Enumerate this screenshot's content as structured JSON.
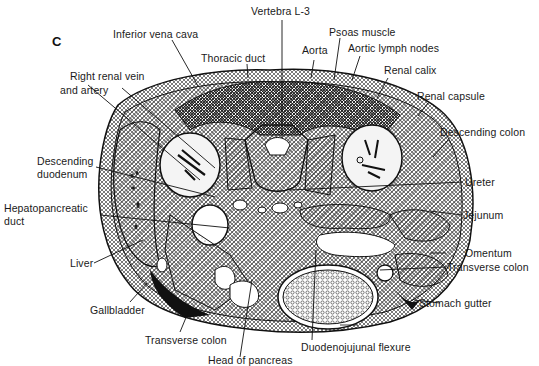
{
  "figure": {
    "panel_letter": "C",
    "colors": {
      "ink": "#1a1a1a",
      "background": "#ffffff",
      "light_tissue": "#f4f4f4"
    }
  },
  "labels": {
    "vertebra": "Vertebra L-3",
    "inferior_vena_cava": "Inferior vena cava",
    "thoracic_duct": "Thoracic duct",
    "psoas_muscle": "Psoas muscle",
    "aorta": "Aorta",
    "aortic_lymph_nodes": "Aortic lymph nodes",
    "renal_calix": "Renal calix",
    "renal_capsule": "Renal capsule",
    "right_renal_vein_line1": "Right renal vein",
    "right_renal_vein_line2": "and artery",
    "descending_colon": "Descending colon",
    "descending_duodenum_line1": "Descending",
    "descending_duodenum_line2": "duodenum",
    "hepatopancreatic_line1": "Hepatopancreatic",
    "hepatopancreatic_line2": "duct",
    "ureter": "Ureter",
    "jejunum": "Jejunum",
    "liver": "Liver",
    "omentum": "Omentum",
    "transverse_colon_right": "Transverse colon",
    "stomach_gutter": "Stomach gutter",
    "gallbladder": "Gallbladder",
    "transverse_colon_left": "Transverse colon",
    "duodenojejunal_flexure": "Duodenojujunal flexure",
    "head_of_pancreas": "Head of pancreas"
  }
}
